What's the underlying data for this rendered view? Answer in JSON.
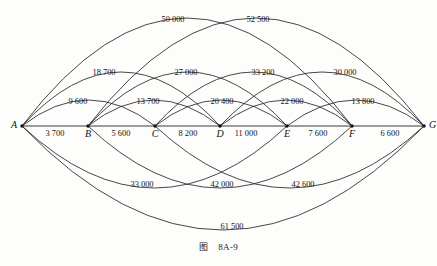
{
  "figure": {
    "caption_label": "图",
    "caption_number": "8A-9",
    "background_color": "#fdfdfc",
    "line_color": "#262626"
  },
  "chart_data": {
    "type": "diagram",
    "subtype": "weighted-graph-arc-diagram",
    "xlabel": "",
    "ylabel": "",
    "grid": false,
    "legend": "none",
    "nodes": [
      {
        "id": "A",
        "label": "A",
        "x": 22,
        "y": 126
      },
      {
        "id": "B",
        "label": "B",
        "x": 88,
        "y": 126
      },
      {
        "id": "C",
        "label": "C",
        "x": 155,
        "y": 126
      },
      {
        "id": "D",
        "label": "D",
        "x": 220,
        "y": 126
      },
      {
        "id": "E",
        "label": "E",
        "x": 287,
        "y": 126
      },
      {
        "id": "F",
        "label": "F",
        "x": 352,
        "y": 126
      },
      {
        "id": "G",
        "label": "G",
        "x": 424,
        "y": 126
      }
    ],
    "edges": [
      {
        "from": "A",
        "to": "B",
        "value": 3700,
        "label": "3 700",
        "span": 1,
        "side": "baseline",
        "label_x": 55,
        "label_y": 136
      },
      {
        "from": "B",
        "to": "C",
        "value": 5600,
        "label": "5 600",
        "span": 1,
        "side": "baseline",
        "label_x": 121,
        "label_y": 136
      },
      {
        "from": "C",
        "to": "D",
        "value": 8200,
        "label": "8 200",
        "span": 1,
        "side": "baseline",
        "label_x": 188,
        "label_y": 136
      },
      {
        "from": "D",
        "to": "E",
        "value": 11000,
        "label": "11 000",
        "span": 1,
        "side": "baseline",
        "label_x": 246,
        "label_y": 136
      },
      {
        "from": "E",
        "to": "F",
        "value": 7600,
        "label": "7 600",
        "span": 1,
        "side": "baseline",
        "label_x": 318,
        "label_y": 136
      },
      {
        "from": "F",
        "to": "G",
        "value": 6600,
        "label": "6 600",
        "span": 1,
        "side": "baseline",
        "label_x": 390,
        "label_y": 136
      },
      {
        "from": "A",
        "to": "C",
        "value": 9600,
        "label": "9 600",
        "span": 2,
        "side": "above",
        "label_x": 78,
        "label_y": 104
      },
      {
        "from": "B",
        "to": "D",
        "value": 13700,
        "label": "13 700",
        "span": 2,
        "side": "above",
        "label_x": 148,
        "label_y": 104
      },
      {
        "from": "C",
        "to": "E",
        "value": 20400,
        "label": "20 400",
        "span": 2,
        "side": "above",
        "label_x": 222,
        "label_y": 104
      },
      {
        "from": "D",
        "to": "F",
        "value": 22000,
        "label": "22 000",
        "span": 2,
        "side": "above",
        "label_x": 292,
        "label_y": 104
      },
      {
        "from": "E",
        "to": "G",
        "value": 13800,
        "label": "13 800",
        "span": 2,
        "side": "above",
        "label_x": 363,
        "label_y": 104
      },
      {
        "from": "A",
        "to": "D",
        "value": 18700,
        "label": "18 700",
        "span": 3,
        "side": "above",
        "label_x": 104,
        "label_y": 75
      },
      {
        "from": "B",
        "to": "E",
        "value": 27000,
        "label": "27 000",
        "span": 3,
        "side": "above",
        "label_x": 186,
        "label_y": 75
      },
      {
        "from": "C",
        "to": "F",
        "value": 33200,
        "label": "33 200",
        "span": 3,
        "side": "above",
        "label_x": 263,
        "label_y": 75
      },
      {
        "from": "D",
        "to": "G",
        "value": 30000,
        "label": "30 000",
        "span": 3,
        "side": "above",
        "label_x": 345,
        "label_y": 75
      },
      {
        "from": "A",
        "to": "F",
        "value": 50000,
        "label": "50 000",
        "span": 5,
        "side": "above",
        "label_x": 173,
        "label_y": 22
      },
      {
        "from": "B",
        "to": "G",
        "value": 52500,
        "label": "52 500",
        "span": 5,
        "side": "above",
        "label_x": 258,
        "label_y": 22
      },
      {
        "from": "A",
        "to": "E",
        "value": 33000,
        "label": "33 000",
        "span": 4,
        "side": "below",
        "label_x": 142,
        "label_y": 187
      },
      {
        "from": "B",
        "to": "F",
        "value": 42000,
        "label": "42 000",
        "span": 4,
        "side": "below",
        "label_x": 222,
        "label_y": 187
      },
      {
        "from": "C",
        "to": "G",
        "value": 42600,
        "label": "42 600",
        "span": 4,
        "side": "below",
        "label_x": 303,
        "label_y": 187
      },
      {
        "from": "A",
        "to": "G",
        "value": 61500,
        "label": "61 500",
        "span": 6,
        "side": "below",
        "label_x": 232,
        "label_y": 229
      }
    ]
  }
}
